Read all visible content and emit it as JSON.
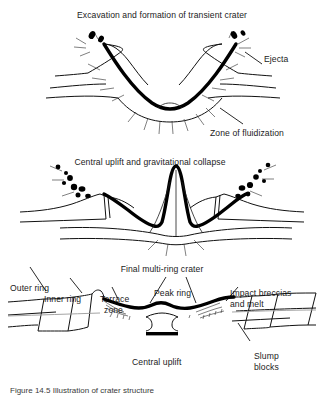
{
  "figure": {
    "type": "schematic-diagram",
    "panel_count": 3
  },
  "panels": [
    {
      "id": "stage-1",
      "title": "Excavation and formation of transient crater",
      "labels": [
        {
          "name": "ejecta",
          "text": "Ejecta"
        },
        {
          "name": "zone-of-fluidization",
          "text": "Zone of fluidization"
        }
      ]
    },
    {
      "id": "stage-2",
      "title": "Central uplift and gravitational collapse",
      "labels": []
    },
    {
      "id": "stage-3",
      "title": "Final multi-ring crater",
      "labels": [
        {
          "name": "outer-ring",
          "text": "Outer ring"
        },
        {
          "name": "inner-ring",
          "text": "Inner ring"
        },
        {
          "name": "terrace-zone",
          "text": "Terrace\nzone"
        },
        {
          "name": "peak-ring",
          "text": "Peak ring"
        },
        {
          "name": "impact-breccias-and-melt",
          "text": "Impact breccias\nand melt"
        },
        {
          "name": "central-uplift",
          "text": "Central uplift"
        },
        {
          "name": "slump-blocks",
          "text": "Slump\nblocks"
        }
      ]
    }
  ],
  "labels": {
    "stage1_title": "Excavation and formation of transient crater",
    "ejecta": "Ejecta",
    "zone_of_fluidization": "Zone of fluidization",
    "stage2_title": "Central uplift and gravitational collapse",
    "stage3_title": "Final multi-ring crater",
    "outer_ring": "Outer ring",
    "inner_ring": "Inner ring",
    "terrace_zone_line1": "Terrace",
    "terrace_zone_line2": "zone",
    "peak_ring": "Peak ring",
    "impact_breccias_line1": "Impact breccias",
    "impact_breccias_line2": "and melt",
    "central_uplift": "Central uplift",
    "slump_blocks_line1": "Slump",
    "slump_blocks_line2": "blocks"
  },
  "caption": {
    "text": "Figure 14.5  Illustration of crater structure",
    "truncated": true
  },
  "colors": {
    "background": "#ffffff",
    "ink": "#111111",
    "melt_layer": "#000000",
    "faint_horizon": "#9a9a9a",
    "text": "#1b1b1b"
  }
}
